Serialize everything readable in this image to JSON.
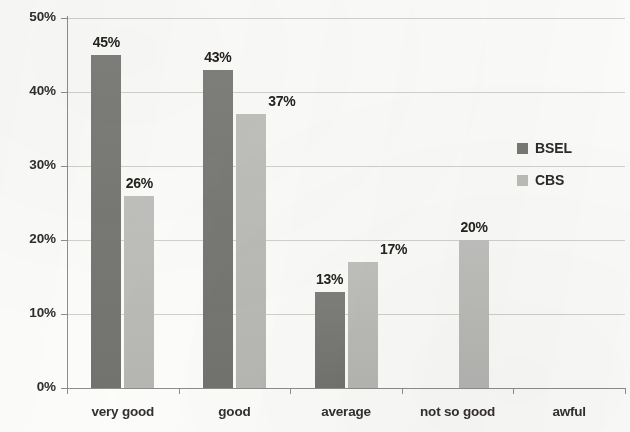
{
  "chart_data": {
    "type": "bar",
    "title": "",
    "subtitle": "",
    "xlabel": "",
    "ylabel": "",
    "categories": [
      "very good",
      "good",
      "average",
      "not so good",
      "awful"
    ],
    "series": [
      {
        "name": "BSEL",
        "color": "#787875",
        "values": [
          45,
          43,
          13,
          0,
          0
        ],
        "labels": [
          "45%",
          "43%",
          "13%",
          "",
          ""
        ]
      },
      {
        "name": "CBS",
        "color": "#bdbdba",
        "values": [
          26,
          37,
          17,
          20,
          0
        ],
        "labels": [
          "26%",
          "37%",
          "17%",
          "20%",
          ""
        ]
      }
    ],
    "ylim": [
      0,
      50
    ],
    "ytick_values": [
      0,
      10,
      20,
      30,
      40,
      50
    ],
    "ytick_labels": [
      "0%",
      "10%",
      "20%",
      "30%",
      "40%",
      "50%"
    ],
    "grid": true,
    "grid_axis": "y",
    "legend_position": "right",
    "value_labels_shown": true
  },
  "legend": {
    "items": [
      {
        "label": "BSEL",
        "color": "#787875"
      },
      {
        "label": "CBS",
        "color": "#bdbdba"
      }
    ]
  },
  "colors": {
    "series_bsel": "#787875",
    "series_cbs": "#bdbdba",
    "gridline": "#c9c9c6",
    "axis": "#8d8d8a",
    "background": "#fcfcfa",
    "text": "#2c2a28"
  }
}
